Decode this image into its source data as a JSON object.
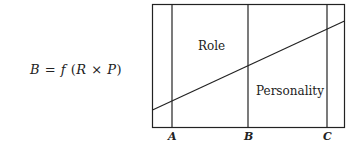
{
  "formula": {
    "lhs": "B",
    "equals": "=",
    "func": "f",
    "open": "(",
    "arg1": "R",
    "times": "×",
    "arg2": "P",
    "close": ")"
  },
  "diagram": {
    "regions": {
      "upper_label": "Role",
      "lower_label": "Personality"
    },
    "axis_labels": [
      "A",
      "B",
      "C"
    ],
    "line_color": "#222222"
  }
}
